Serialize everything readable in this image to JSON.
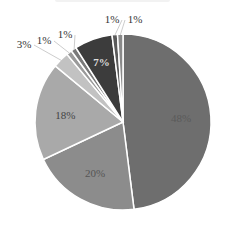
{
  "chart_data": {
    "type": "pie",
    "title": "",
    "start_angle_deg": 0,
    "direction": "clockwise",
    "slices": [
      {
        "label": "48%",
        "value": 48,
        "color": "#6e6e6e",
        "label_color": "#5a5a5a",
        "label_pos": "inside"
      },
      {
        "label": "20%",
        "value": 20,
        "color": "#8c8c8c",
        "label_color": "#555555",
        "label_pos": "inside"
      },
      {
        "label": "18%",
        "value": 18,
        "color": "#a9a9a9",
        "label_color": "#444444",
        "label_pos": "inside"
      },
      {
        "label": "3%",
        "value": 3,
        "color": "#c2c2c2",
        "label_color": "#333333",
        "label_pos": "outside"
      },
      {
        "label": "1%",
        "value": 1,
        "color": "#9a9a9a",
        "label_color": "#333333",
        "label_pos": "outside"
      },
      {
        "label": "1%",
        "value": 1,
        "color": "#7a7a7a",
        "label_color": "#333333",
        "label_pos": "outside"
      },
      {
        "label": "7%",
        "value": 7,
        "color": "#3c3c3c",
        "label_color": "#dddddd",
        "label_pos": "inside"
      },
      {
        "label": "1%",
        "value": 1,
        "color": "#5a5a5a",
        "label_color": "#333333",
        "label_pos": "outside"
      },
      {
        "label": "1%",
        "value": 1,
        "color": "#8a8a8a",
        "label_color": "#333333",
        "label_pos": "outside"
      }
    ],
    "legend": null,
    "grid": false
  },
  "layout": {
    "cx": 123,
    "cy": 122,
    "r": 88,
    "separator_color": "#ffffff"
  }
}
